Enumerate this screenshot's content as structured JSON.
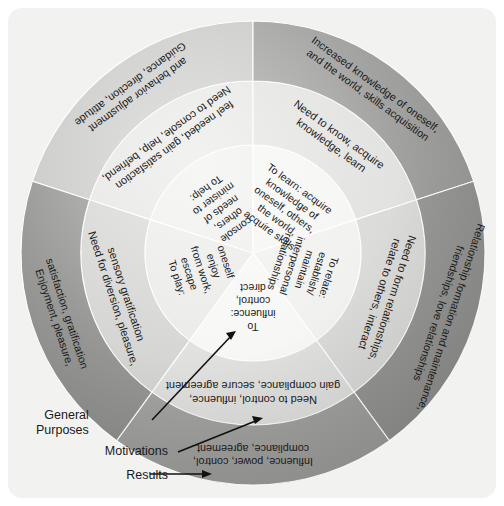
{
  "diagram": {
    "center": {
      "x": 253,
      "y": 253
    },
    "rings": [
      {
        "key": "inner",
        "name": "Motivations",
        "r_inner": 0,
        "r_outer": 108
      },
      {
        "key": "middle",
        "name": "General Purposes",
        "r_inner": 108,
        "r_outer": 172
      },
      {
        "key": "outer",
        "name": "Results",
        "r_inner": 172,
        "r_outer": 232
      }
    ],
    "sectors": [
      {
        "key": "help",
        "start_deg": 198,
        "end_deg": 270,
        "inner": "To help:\nminister to\nneeds of\nothers,\nconsole",
        "middle": "Need to console, help, befriend,\nfeel needed, gain satisfaction",
        "outer": "Guidance, direction, attitude\nand behavior adjustment",
        "shade_inner": "#ececea",
        "shade_middle": "#e2e2e0",
        "shade_outer": "#c3c3c1"
      },
      {
        "key": "learn",
        "start_deg": 270,
        "end_deg": 342,
        "inner": "To learn: acquire\nknowledge of\noneself, others,\nthe world,\nacquire skills",
        "middle": "Need to know, acquire\nknowledge, learn",
        "outer": "Increased knowledge of oneself,\nand the world, skills acquisition",
        "shade_inner": "#f4f4f2",
        "shade_middle": "#dededc",
        "shade_outer": "#959593"
      },
      {
        "key": "relate",
        "start_deg": 342,
        "end_deg": 54,
        "inner": "To relate:\nestablish/\nmaintain\ninterpersonal\nrelationships",
        "middle": "Need to form relationships,\nrelate to others, interact",
        "outer": "Relationship formation and maintenance,\nfriendships, love relationships",
        "shade_inner": "#efefed",
        "shade_middle": "#d6d6d4",
        "shade_outer": "#8e8e8c"
      },
      {
        "key": "influence",
        "start_deg": 54,
        "end_deg": 126,
        "inner": "To\ninfluence:\ncontrol,\ndirect",
        "middle": "Need to control, influence,\ngain compliance, secure agreement",
        "outer": "Influence, power, control,\ncompliance, agreement",
        "shade_inner": "#f6f6f4",
        "shade_middle": "#dcdcda",
        "shade_outer": "#9a9a98"
      },
      {
        "key": "play",
        "start_deg": 126,
        "end_deg": 198,
        "inner": "To play:\nescape\nfrom work,\nenjoy\noneself",
        "middle": "Need for diversion, pleasure,\nsensory gratification",
        "outer": "Enjoyment, pleasure,\nsatisfaction, gratification",
        "shade_inner": "#e8e8e6",
        "shade_middle": "#d0d0ce",
        "shade_outer": "#8a8a88"
      }
    ]
  },
  "legend": {
    "general_purposes": "General\nPurposes",
    "motivations": "Motivations",
    "results": "Results"
  },
  "colors": {
    "panel_background": "#f2f2f0",
    "page_background": "#ffffff",
    "text": "#1a1a1a",
    "arrow": "#111111"
  }
}
